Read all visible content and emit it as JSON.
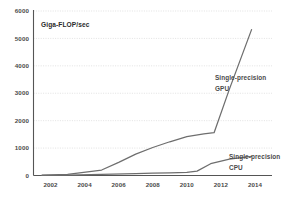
{
  "chart_data": {
    "type": "line",
    "title": "Giga-FLOP/sec",
    "xlabel": "",
    "ylabel": "Giga-FLOP/sec",
    "xlim": [
      2001,
      2015
    ],
    "ylim": [
      0,
      6000
    ],
    "grid": true,
    "legend_position": "inline-right",
    "x_ticks": [
      "2002",
      "2004",
      "2006",
      "2008",
      "2010",
      "2012",
      "2014"
    ],
    "x_tick_values": [
      2002,
      2004,
      2006,
      2008,
      2010,
      2012,
      2014
    ],
    "y_ticks": [
      "0",
      "1000",
      "2000",
      "3000",
      "4000",
      "5000",
      "6000"
    ],
    "y_tick_values": [
      0,
      1000,
      2000,
      3000,
      4000,
      5000,
      6000
    ],
    "series": [
      {
        "name": "Single-precision GPU",
        "color": "#6e6e6e",
        "label_line1": "Single-precision",
        "label_line2": "GPU",
        "x": [
          2001.5,
          2003,
          2005,
          2006,
          2007,
          2008,
          2009,
          2010,
          2011,
          2011.6,
          2012.5,
          2013.8
        ],
        "values": [
          10,
          40,
          200,
          480,
          780,
          1020,
          1230,
          1420,
          1520,
          1560,
          3150,
          5320
        ]
      },
      {
        "name": "Single-precision CPU",
        "color": "#6e6e6e",
        "label_line1": "Single-precision",
        "label_line2": "CPU",
        "x": [
          2001.5,
          2003,
          2005,
          2007,
          2008,
          2009,
          2010,
          2010.6,
          2011.4,
          2012.5,
          2013.8
        ],
        "values": [
          5,
          15,
          40,
          70,
          90,
          100,
          110,
          160,
          430,
          600,
          700
        ]
      }
    ]
  }
}
